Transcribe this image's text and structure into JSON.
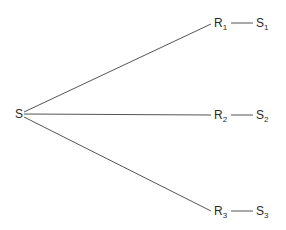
{
  "diagram": {
    "type": "tree",
    "root": {
      "label": "S",
      "sub": ""
    },
    "branches": [
      {
        "node": {
          "label": "R",
          "sub": "1"
        },
        "leaf": {
          "label": "S",
          "sub": "1"
        }
      },
      {
        "node": {
          "label": "R",
          "sub": "2"
        },
        "leaf": {
          "label": "S",
          "sub": "2"
        }
      },
      {
        "node": {
          "label": "R",
          "sub": "3"
        },
        "leaf": {
          "label": "S",
          "sub": "3"
        }
      }
    ],
    "colors": {
      "line": "#555555",
      "text": "#2a2a2a",
      "background": "#ffffff"
    }
  }
}
